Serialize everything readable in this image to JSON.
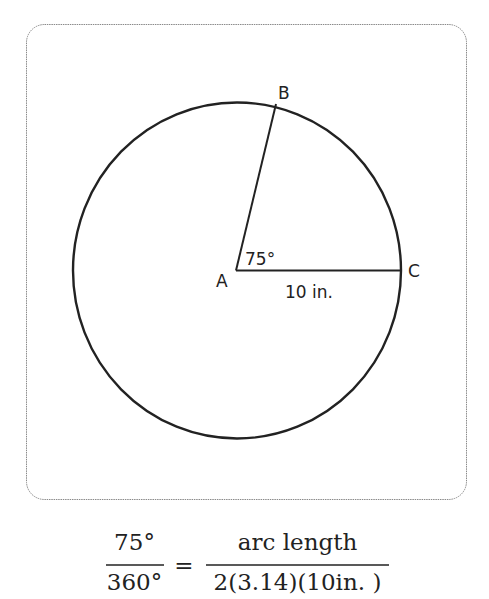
{
  "diagram": {
    "points": {
      "A": "A",
      "B": "B",
      "C": "C"
    },
    "angle_label": "75°",
    "radius_label": "10 in.",
    "colors": {
      "stroke": "#222222",
      "frame": "#888888",
      "background": "#ffffff"
    }
  },
  "equation": {
    "left_numerator": "75°",
    "left_denominator": "360°",
    "equals": "=",
    "right_numerator": "arc length",
    "right_denominator": "2(3.14)(10in. )"
  }
}
